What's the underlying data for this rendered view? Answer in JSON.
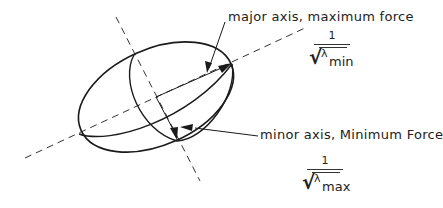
{
  "diagram": {
    "type": "ellipsoid-force-diagram",
    "labels": {
      "major": "major axis, maximum force",
      "minor": "minor axis, Minimum Force"
    },
    "formulas": {
      "min": {
        "numerator": "1",
        "symbol": "λ",
        "subscript": "min"
      },
      "max": {
        "numerator": "1",
        "symbol": "λ",
        "subscript": "max"
      }
    },
    "colors": {
      "stroke": "#1a1a1a",
      "background": "#ffffff"
    }
  }
}
